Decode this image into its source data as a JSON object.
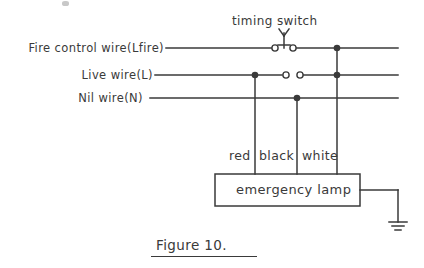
{
  "figure": {
    "caption": "Figure 10.",
    "title_label": "timing switch"
  },
  "wires": [
    {
      "label": "Fire control wire(Lfire)",
      "name": "fire-control-wire"
    },
    {
      "label": "Live wire(L)",
      "name": "live-wire"
    },
    {
      "label": "Nil wire(N)",
      "name": "nil-wire"
    }
  ],
  "conductors": [
    {
      "label": "red"
    },
    {
      "label": "black"
    },
    {
      "label": "white"
    }
  ],
  "load": {
    "label": "emergency lamp"
  },
  "symbols": {
    "timing_switch": "timing-switch-icon",
    "ground": "ground-icon",
    "junction": "junction-dot",
    "terminal": "open-terminal-circle"
  },
  "colors": {
    "ink": "#3a3a3a",
    "background": "#ffffff"
  }
}
